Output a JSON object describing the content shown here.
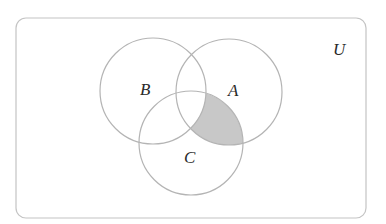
{
  "diagram": {
    "type": "venn",
    "universe": {
      "label": "U"
    },
    "sets": [
      {
        "label": "A"
      },
      {
        "label": "B"
      },
      {
        "label": "C"
      }
    ],
    "shaded_region": "A ∩ C ∩ B'",
    "colors": {
      "outline": "#b4b4b4",
      "shade": "#c8c8c8",
      "shade_edge": "#8a8a8a",
      "text": "#2a2a2a"
    }
  }
}
